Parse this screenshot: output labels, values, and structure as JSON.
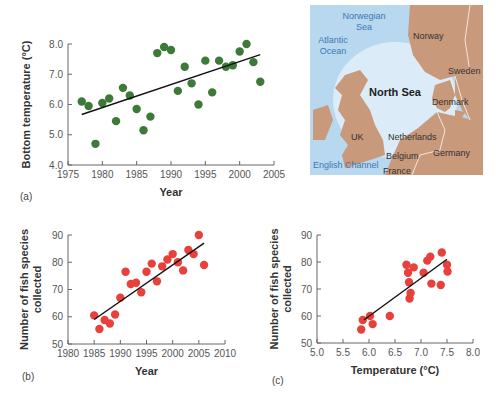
{
  "chart_data": [
    {
      "type": "scatter",
      "panel": "(a)",
      "xlabel": "Year",
      "ylabel": "Bottom temperature (°C)",
      "xlim": [
        1975,
        2005
      ],
      "ylim": [
        4.0,
        8.0
      ],
      "xticks": [
        "1975",
        "1980",
        "1985",
        "1990",
        "1995",
        "2000",
        "2005"
      ],
      "yticks": [
        "4.0",
        "5.0",
        "6.0",
        "7.0",
        "8.0"
      ],
      "color": "#3d7a3a",
      "trendline": {
        "x": [
          1977,
          2003
        ],
        "y": [
          5.67,
          7.65
        ]
      },
      "x": [
        1977,
        1978,
        1979,
        1980,
        1981,
        1982,
        1983,
        1984,
        1985,
        1986,
        1987,
        1988,
        1989,
        1990,
        1991,
        1992,
        1993,
        1994,
        1995,
        1996,
        1997,
        1998,
        1999,
        2000,
        2001,
        2002,
        2003
      ],
      "y": [
        6.1,
        5.95,
        4.7,
        6.05,
        6.2,
        5.45,
        6.55,
        6.3,
        5.85,
        5.15,
        5.6,
        7.7,
        7.9,
        7.8,
        6.45,
        7.25,
        6.7,
        6.0,
        7.45,
        6.4,
        7.45,
        7.25,
        7.3,
        7.75,
        8.0,
        7.4,
        6.75
      ]
    },
    {
      "type": "scatter",
      "panel": "(b)",
      "xlabel": "Year",
      "ylabel": "Number of fish species collected",
      "xlim": [
        1980,
        2010
      ],
      "ylim": [
        50,
        90
      ],
      "xticks": [
        "1980",
        "1985",
        "1990",
        "1995",
        "2000",
        "2005",
        "2010"
      ],
      "yticks": [
        "50",
        "60",
        "70",
        "80",
        "90"
      ],
      "color": "#e8413c",
      "trendline": {
        "x": [
          1985,
          2006
        ],
        "y": [
          59,
          87
        ]
      },
      "x": [
        1985,
        1986,
        1987,
        1988,
        1989,
        1990,
        1991,
        1992,
        1993,
        1994,
        1995,
        1996,
        1997,
        1998,
        1999,
        2000,
        2001,
        2002,
        2003,
        2004,
        2005,
        2006
      ],
      "y": [
        60.5,
        55.5,
        58.8,
        57.5,
        60.8,
        67,
        76.5,
        72,
        72.5,
        69,
        76.5,
        79.5,
        73,
        78.5,
        81,
        83,
        80,
        77,
        84.5,
        83,
        90,
        79
      ]
    },
    {
      "type": "scatter",
      "panel": "(c)",
      "xlabel": "Temperature (°C)",
      "ylabel": "Number of fish species collected",
      "xlim": [
        5.0,
        8.0
      ],
      "ylim": [
        50,
        90
      ],
      "xticks": [
        "5.0",
        "5.5",
        "6.0",
        "6.5",
        "7.0",
        "7.5",
        "8.0"
      ],
      "yticks": [
        "50",
        "60",
        "70",
        "80",
        "90"
      ],
      "color": "#e8413c",
      "trendline": {
        "x": [
          5.9,
          7.5
        ],
        "y": [
          58.5,
          81
        ]
      },
      "x": [
        5.85,
        5.88,
        6.02,
        6.07,
        6.4,
        6.72,
        6.75,
        6.77,
        6.78,
        6.8,
        6.86,
        7.05,
        7.12,
        7.18,
        7.2,
        7.38,
        7.4,
        7.5,
        7.51
      ],
      "y": [
        55,
        58.5,
        60,
        57,
        60,
        79,
        76,
        72.5,
        66.5,
        68.5,
        78,
        76,
        80.5,
        82,
        72,
        71.5,
        83.5,
        79,
        76.5
      ]
    }
  ],
  "panels": {
    "a": {
      "label": "(a)"
    },
    "b": {
      "label": "(b)"
    },
    "c": {
      "label": "(c)"
    }
  },
  "map": {
    "title": "North Sea",
    "labels": {
      "norwegian_sea_1": "Norwegian",
      "norwegian_sea_2": "Sea",
      "atlantic_1": "Atlantic",
      "atlantic_2": "Ocean",
      "norway": "Norway",
      "sweden": "Sweden",
      "denmark": "Denmark",
      "uk": "UK",
      "netherlands": "Netherlands",
      "belgium": "Belgium",
      "germany": "Germany",
      "france": "France",
      "english_channel": "English Channel"
    },
    "colors": {
      "sea": "#b7d8ef",
      "sea_light": "#dbecf8",
      "land": "#c9997b",
      "border": "#f3e7dc"
    }
  }
}
